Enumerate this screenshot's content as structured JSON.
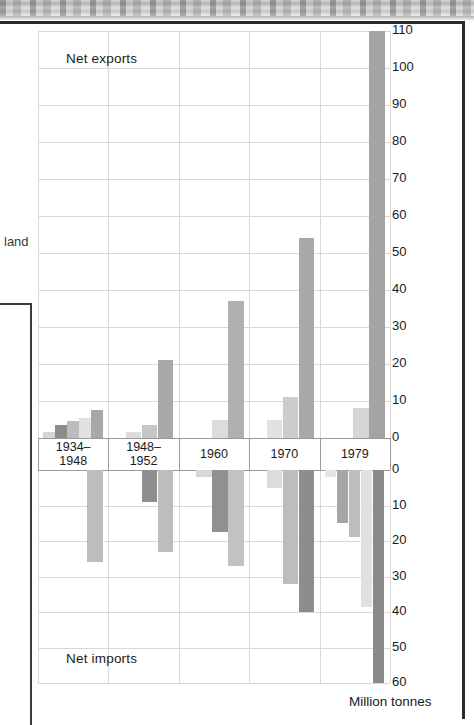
{
  "figure": {
    "side_label": "land",
    "units_label": "Million tonnes",
    "exports_label": "Net exports",
    "imports_label": "Net imports"
  },
  "chart_data": {
    "type": "bar",
    "title": "",
    "subtitle": "",
    "xlabel": "",
    "ylabel": "Million tonnes",
    "orientation": "vertical",
    "grid": true,
    "legend_position": "none",
    "note": "Split-axis grouped bar chart: upper panel shows net exports (0 to 110), lower panel shows net imports (0 to 60 measured downward). Series are distinguished only by grey shading; no legend is printed.",
    "categories": [
      "1934–1948",
      "1948–1952",
      "1960",
      "1970",
      "1979"
    ],
    "panels": [
      {
        "name": "Net exports",
        "ylim": [
          0,
          110
        ],
        "ytick_labels": [
          "0",
          "10",
          "20",
          "30",
          "40",
          "50",
          "60",
          "70",
          "80",
          "90",
          "100",
          "110"
        ],
        "ytick_values": [
          0,
          10,
          20,
          30,
          40,
          50,
          60,
          70,
          80,
          90,
          100,
          110
        ],
        "groups": [
          {
            "category": "1934–1948",
            "values": [
              1.5,
              3.5,
              4.5,
              5.5,
              7.5
            ],
            "shades": [
              "#d4d4d4",
              "#8c8c8c",
              "#bcbcbc",
              "#e2e2e2",
              "#a8a8a8"
            ]
          },
          {
            "category": "1948–1952",
            "values": [
              1.5,
              3.5,
              21.0
            ],
            "shades": [
              "#dcdcdc",
              "#c6c6c6",
              "#a8a8a8"
            ]
          },
          {
            "category": "1960",
            "values": [
              5.0,
              37.0
            ],
            "shades": [
              "#dcdcdc",
              "#b0b0b0"
            ]
          },
          {
            "category": "1970",
            "values": [
              5.0,
              11.0,
              54.0
            ],
            "shades": [
              "#e2e2e2",
              "#cccccc",
              "#a8a8a8"
            ]
          },
          {
            "category": "1979",
            "values": [
              8.0,
              110.0
            ],
            "shades": [
              "#d6d6d6",
              "#a4a4a4"
            ]
          }
        ]
      },
      {
        "name": "Net imports",
        "ylim": [
          0,
          60
        ],
        "ytick_labels": [
          "0",
          "10",
          "20",
          "30",
          "40",
          "50",
          "60"
        ],
        "ytick_values": [
          0,
          10,
          20,
          30,
          40,
          50,
          60
        ],
        "groups": [
          {
            "category": "1934–1948",
            "values": [
              26.0
            ],
            "shades": [
              "#bdbdbd"
            ]
          },
          {
            "category": "1948–1952",
            "values": [
              9.0,
              23.0
            ],
            "shades": [
              "#8f8f8f",
              "#bdbdbd"
            ]
          },
          {
            "category": "1960",
            "values": [
              2.0,
              17.5,
              27.0
            ],
            "shades": [
              "#d8d8d8",
              "#909090",
              "#c2c2c2"
            ]
          },
          {
            "category": "1970",
            "values": [
              5.0,
              32.0,
              40.0
            ],
            "shades": [
              "#dcdcdc",
              "#bdbdbd",
              "#8d8d8d"
            ]
          },
          {
            "category": "1979",
            "values": [
              2.0,
              15.0,
              19.0,
              38.5,
              60.0
            ],
            "shades": [
              "#e4e4e4",
              "#a6a6a6",
              "#bdbdbd",
              "#e0e0e0",
              "#8a8a8a"
            ]
          }
        ]
      }
    ]
  },
  "axis_right": {
    "upper_ticks": [
      "110",
      "100",
      "90",
      "80",
      "70",
      "60",
      "50",
      "40",
      "30",
      "20",
      "10",
      "0"
    ],
    "lower_ticks": [
      "0",
      "10",
      "20",
      "30",
      "40",
      "50",
      "60"
    ]
  }
}
